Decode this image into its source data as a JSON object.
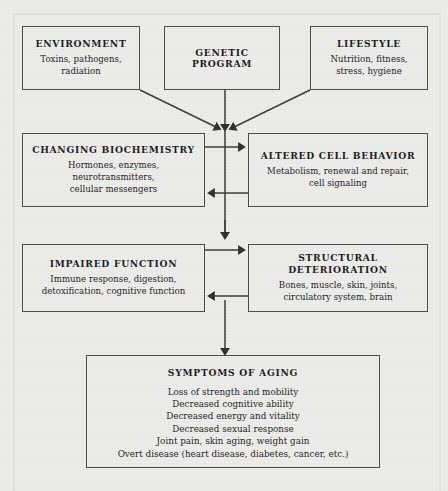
{
  "diagram": {
    "colors": {
      "background": "#ececeb",
      "box_border": "#4a4a4a",
      "text": "#1b1b1b",
      "arrow": "#3a3a3a"
    },
    "nodes": [
      {
        "id": "environment",
        "title": "ENVIRONMENT",
        "body": "Toxins, pathogens,\nradiation"
      },
      {
        "id": "genetic_program",
        "title": "GENETIC\nPROGRAM",
        "body": ""
      },
      {
        "id": "lifestyle",
        "title": "LIFESTYLE",
        "body": "Nutrition, fitness,\nstress, hygiene"
      },
      {
        "id": "changing_biochemistry",
        "title": "CHANGING BIOCHEMISTRY",
        "body": "Hormones, enzymes,\nneurotransmitters,\ncellular messengers"
      },
      {
        "id": "altered_cell_behavior",
        "title": "ALTERED CELL BEHAVIOR",
        "body": "Metabolism, renewal and repair,\ncell signaling"
      },
      {
        "id": "impaired_function",
        "title": "IMPAIRED FUNCTION",
        "body": "Immune response, digestion,\ndetoxification,  cognitive function"
      },
      {
        "id": "structural_deterioration",
        "title": "STRUCTURAL DETERIORATION",
        "body": "Bones, muscle, skin, joints,\ncirculatory system, brain"
      },
      {
        "id": "symptoms_of_aging",
        "title": "SYMPTOMS OF AGING",
        "body": "Loss of strength and mobility\nDecreased cognitive ability\nDecreased energy and vitality\nDecreased sexual response\nJoint pain, skin aging, weight gain\nOvert disease (heart disease, diabetes, cancer, etc.)"
      }
    ],
    "edges": [
      {
        "from": "environment",
        "to": "changing_biochemistry",
        "style": "diagonal-arrow"
      },
      {
        "from": "genetic_program",
        "to": "changing_biochemistry",
        "style": "vertical-arrow"
      },
      {
        "from": "lifestyle",
        "to": "changing_biochemistry",
        "style": "diagonal-arrow"
      },
      {
        "from": "changing_biochemistry",
        "to": "altered_cell_behavior",
        "style": "horizontal-arrow-right"
      },
      {
        "from": "altered_cell_behavior",
        "to": "changing_biochemistry",
        "style": "horizontal-arrow-left"
      },
      {
        "from": "changing_biochemistry",
        "to": "impaired_function",
        "style": "vertical-arrow"
      },
      {
        "from": "impaired_function",
        "to": "structural_deterioration",
        "style": "horizontal-arrow-right"
      },
      {
        "from": "structural_deterioration",
        "to": "impaired_function",
        "style": "horizontal-arrow-left"
      },
      {
        "from": "impaired_function",
        "to": "symptoms_of_aging",
        "style": "vertical-arrow"
      }
    ]
  }
}
